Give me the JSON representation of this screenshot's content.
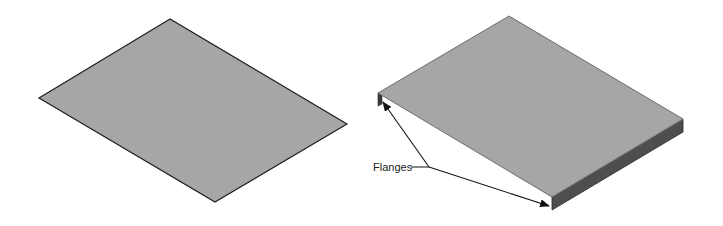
{
  "figure": {
    "left_part": {
      "description": "Flat sheet (blank) before bending"
    },
    "right_part": {
      "description": "Sheet with two bent flanges"
    },
    "callout": {
      "label": "Flanges"
    }
  },
  "colors": {
    "sheet_top": "#a6a6a6",
    "flange_face": "#5a5a5a",
    "flange_edge": "#3c3c3c",
    "outline": "#1e1e1e"
  }
}
